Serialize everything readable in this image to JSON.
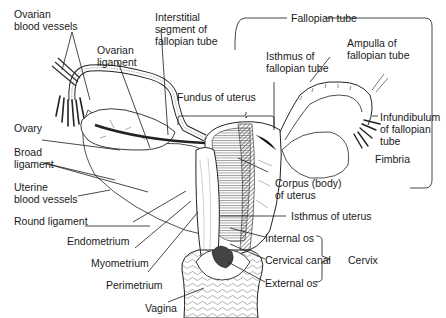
{
  "figure": {
    "colors": {
      "ink": "#1a1a1a",
      "background": "#ffffff",
      "shade": "#9a9a9a"
    }
  },
  "labels": {
    "ovarian_blood_vessels": [
      "Ovarian",
      "blood vessels"
    ],
    "ovarian_ligament": [
      "Ovarian",
      "ligament"
    ],
    "interstitial_segment": [
      "Interstitial",
      "segment of",
      "fallopian tube"
    ],
    "fundus": "Fundus of uterus",
    "fallopian_tube": "Fallopian tube",
    "isthmus_of_tube": [
      "Isthmus of",
      "fallopian tube"
    ],
    "ampulla": [
      "Ampulla of",
      "fallopian tube"
    ],
    "infundibulum": [
      "Infundibulum",
      "of fallopian",
      "tube"
    ],
    "fimbria": "Fimbria",
    "ovary": "Ovary",
    "broad_ligament": [
      "Broad",
      "ligament"
    ],
    "uterine_blood_vessels": [
      "Uterine",
      "blood vessels"
    ],
    "round_ligament": "Round ligament",
    "endometrium": "Endometrium",
    "myometrium": "Myometrium",
    "perimetrium": "Perimetrium",
    "vagina": "Vagina",
    "corpus": [
      "Corpus (body)",
      "of uterus"
    ],
    "isthmus_of_uterus": "Isthmus of uterus",
    "internal_os": "Internal os",
    "cervical_canal": "Cervical canal",
    "external_os": "External os",
    "cervix": "Cervix"
  }
}
